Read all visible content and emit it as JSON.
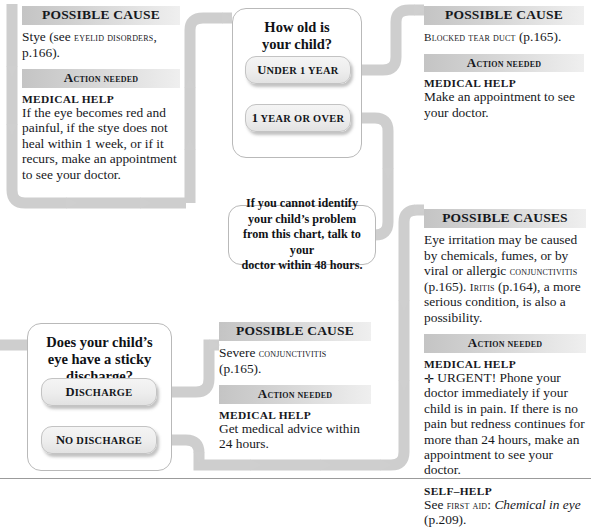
{
  "chart": {
    "accent_gray": "#c8c8c8",
    "bar_gradient_start": "#c4c4c4",
    "bar_gradient_end": "#efefef"
  },
  "panels": {
    "stye": {
      "cause_heading": "POSSIBLE CAUSE",
      "cause_text_1": "Stye (see ",
      "cause_text_sc": "eyelid disorders",
      "cause_text_2": ", p.166).",
      "action_heading_big": "A",
      "action_heading_rest": "CTION NEEDED",
      "medical_help_label": "MEDICAL HELP",
      "medical_help_text": "If the eye becomes red and painful, if the stye does not heal within 1 week, or if it recurs, make an appointment to see your doctor."
    },
    "blocked_tear_duct": {
      "cause_heading": "POSSIBLE CAUSE",
      "cause_text_sc": "Blocked tear duct",
      "cause_text_2": " (p.165).",
      "action_heading_big": "A",
      "action_heading_rest": "CTION NEEDED",
      "medical_help_label": "MEDICAL HELP",
      "medical_help_text": "Make an appointment to see your doctor."
    },
    "eye_irritation": {
      "cause_heading": "POSSIBLE CAUSES",
      "cause_text_1": "Eye irritation may be caused by chemicals, fumes, or by viral or allergic ",
      "cause_sc_1": "conjunctivitis",
      "cause_text_2": " (p.165). ",
      "cause_sc_2": "Iritis",
      "cause_text_3": " (p.164), a more serious condition, is also a possibility.",
      "action_heading_big": "A",
      "action_heading_rest": "CTION NEEDED",
      "medical_help_label": "MEDICAL HELP",
      "urgent_symbol": "✛",
      "medical_help_text": " URGENT! Phone your doctor immediately if your child is in pain. If there is no pain but redness continues for more than 24 hours, make an appointment to see your doctor.",
      "self_help_label": "SELF–HELP",
      "self_help_text_1": "See ",
      "self_help_sc": "first aid",
      "self_help_text_2": ": ",
      "self_help_italic": "Chemical in eye",
      "self_help_text_3": " (p.209)."
    },
    "severe_conjunctivitis": {
      "cause_heading": "POSSIBLE CAUSE",
      "cause_text_1": "Severe ",
      "cause_sc_1": "conjunctivitis",
      "cause_text_2": " (p.165).",
      "action_heading_big": "A",
      "action_heading_rest": "CTION NEEDED",
      "medical_help_label": "MEDICAL HELP",
      "medical_help_text": "Get medical advice within 24 hours."
    }
  },
  "questions": {
    "age": {
      "title_line1": "How old is",
      "title_line2": "your child?",
      "answers": [
        {
          "big": "U",
          "rest": "NDER 1 YEAR"
        },
        {
          "big": "1",
          "rest": " YEAR OR OVER"
        }
      ]
    },
    "discharge": {
      "title_line1": "Does your child’s",
      "title_line2": "eye have a sticky",
      "title_line3": "discharge?",
      "answers": [
        {
          "big": "D",
          "rest": "ISCHARGE"
        },
        {
          "big": "N",
          "rest": "O DISCHARGE"
        }
      ]
    }
  },
  "bubble": {
    "line1": "If you cannot identify",
    "line2": "your child’s problem",
    "line3": "from this chart, talk to your",
    "line4": "doctor within 48 hours."
  }
}
